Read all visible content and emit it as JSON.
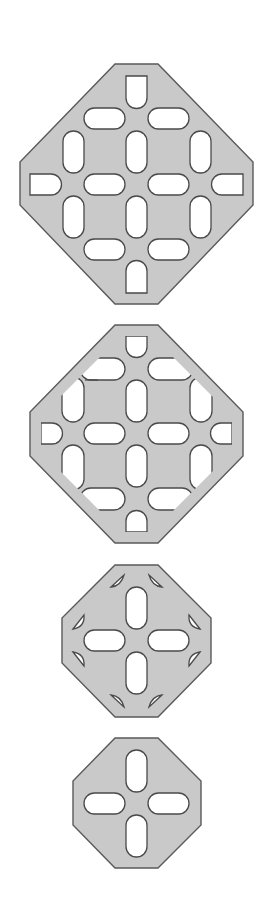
{
  "diagram": {
    "title": "",
    "colors": {
      "background": "#ffffff",
      "plate_fill": "#c9c9c9",
      "plate_outline": "#5a5a5a",
      "hole_fill": "#ffffff",
      "hole_outline": "#4a4a4a"
    },
    "plates": [
      {
        "id": "plate-1",
        "label": "",
        "shape": "octagon",
        "outline": [
          [
            115,
            64
          ],
          [
            158,
            64
          ],
          [
            253,
            162
          ],
          [
            253,
            205
          ],
          [
            158,
            304
          ],
          [
            115,
            304
          ],
          [
            20,
            205
          ],
          [
            20,
            162
          ]
        ],
        "slot_count": 16,
        "slot_style": "rounded slots; edge slots open-ended (half-round)"
      },
      {
        "id": "plate-2",
        "label": "",
        "shape": "octagon",
        "outline": [
          [
            115,
            325
          ],
          [
            158,
            325
          ],
          [
            243,
            412
          ],
          [
            243,
            456
          ],
          [
            158,
            543
          ],
          [
            115,
            543
          ],
          [
            30,
            456
          ],
          [
            30,
            412
          ]
        ],
        "slot_count": 16,
        "slot_style": "rounded slots; outer slots clipped diagonally by inset edge"
      },
      {
        "id": "plate-3",
        "label": "",
        "shape": "octagon",
        "outline": [
          [
            115,
            565
          ],
          [
            158,
            565
          ],
          [
            211,
            618
          ],
          [
            211,
            663
          ],
          [
            158,
            717
          ],
          [
            115,
            717
          ],
          [
            62,
            663
          ],
          [
            62,
            618
          ]
        ],
        "slot_count": 12,
        "slot_style": "4 central rounded slots in cross + 8 small leaf-shaped notches"
      },
      {
        "id": "plate-4",
        "label": "",
        "shape": "octagon",
        "outline": [
          [
            115,
            738
          ],
          [
            158,
            738
          ],
          [
            201,
            781
          ],
          [
            201,
            825
          ],
          [
            158,
            868
          ],
          [
            115,
            868
          ],
          [
            73,
            825
          ],
          [
            73,
            781
          ]
        ],
        "slot_count": 4,
        "slot_style": "4 rounded slots arranged in a cross"
      }
    ]
  }
}
